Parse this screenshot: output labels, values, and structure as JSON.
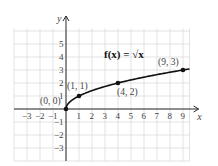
{
  "chart_data": {
    "type": "line",
    "title": "f(x) = √x",
    "function_label": "f(x) = √x",
    "xlabel": "x",
    "ylabel": "y",
    "xlim": [
      -4,
      10
    ],
    "ylim": [
      -4,
      6
    ],
    "grid": true,
    "x_ticks": [
      "-3",
      "-2",
      "-1",
      "1",
      "2",
      "3",
      "4",
      "5",
      "6",
      "7",
      "8",
      "9"
    ],
    "y_ticks": [
      "5",
      "4",
      "3",
      "2",
      "1",
      "-1",
      "-2",
      "-3"
    ],
    "series": [
      {
        "name": "f(x) = √x",
        "x": [
          0,
          0.25,
          1,
          2,
          4,
          6,
          9,
          9.5
        ],
        "y": [
          0,
          0.5,
          1,
          1.414,
          2,
          2.449,
          3,
          3.082
        ]
      }
    ],
    "points": [
      {
        "label": "(0, 0)",
        "x": 0,
        "y": 0
      },
      {
        "label": "(1, 1)",
        "x": 1,
        "y": 1
      },
      {
        "label": "(4, 2)",
        "x": 4,
        "y": 2
      },
      {
        "label": "(9, 3)",
        "x": 9,
        "y": 3
      }
    ]
  }
}
